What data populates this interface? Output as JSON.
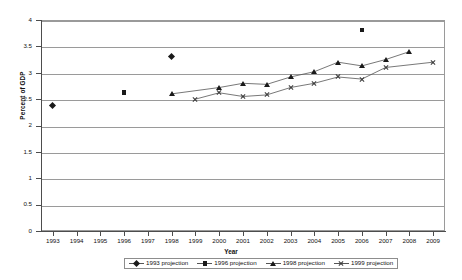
{
  "chart_data": {
    "type": "scatter",
    "title": "",
    "xlabel": "Year",
    "ylabel": "Percent of GDP",
    "xlim": [
      1992.5,
      2009.5
    ],
    "ylim": [
      0,
      4
    ],
    "ytick_step": 0.5,
    "grid": "horizontal",
    "legend_position": "bottom",
    "x_ticks": [
      1993,
      1994,
      1995,
      1996,
      1997,
      1998,
      1999,
      2000,
      2001,
      2002,
      2003,
      2004,
      2005,
      2006,
      2007,
      2008,
      2009
    ],
    "x_tick_labels": [
      "1993",
      "1994",
      "1995",
      "1996",
      "1997",
      "1998",
      "1999",
      "2000",
      "2001",
      "2002",
      "2003",
      "2004",
      "2005",
      "2006",
      "2007",
      "2008",
      "2009"
    ],
    "y_ticks": [
      0,
      0.5,
      1,
      1.5,
      2,
      2.5,
      3,
      3.5,
      4
    ],
    "y_tick_labels": [
      "0",
      "0.5",
      "1",
      "1.5",
      "2",
      "2.5",
      "3",
      "3.5",
      "4"
    ],
    "series": [
      {
        "name": "1993 projection",
        "marker": "diamond",
        "line": false,
        "points": [
          {
            "x": 1993,
            "y": 2.38
          },
          {
            "x": 1998,
            "y": 3.3
          }
        ]
      },
      {
        "name": "1996 projection",
        "marker": "square",
        "line": false,
        "points": [
          {
            "x": 1996,
            "y": 2.62
          },
          {
            "x": 2006,
            "y": 3.81
          }
        ]
      },
      {
        "name": "1998 projection",
        "marker": "triangle",
        "line": true,
        "points": [
          {
            "x": 1998,
            "y": 2.6
          },
          {
            "x": 2000,
            "y": 2.72
          },
          {
            "x": 2001,
            "y": 2.8
          },
          {
            "x": 2002,
            "y": 2.78
          },
          {
            "x": 2003,
            "y": 2.92
          },
          {
            "x": 2004,
            "y": 3.02
          },
          {
            "x": 2005,
            "y": 3.2
          },
          {
            "x": 2006,
            "y": 3.13
          },
          {
            "x": 2007,
            "y": 3.25
          },
          {
            "x": 2008,
            "y": 3.4
          }
        ]
      },
      {
        "name": "1999 projection",
        "marker": "cross",
        "line": true,
        "points": [
          {
            "x": 1999,
            "y": 2.5
          },
          {
            "x": 2000,
            "y": 2.62
          },
          {
            "x": 2001,
            "y": 2.55
          },
          {
            "x": 2002,
            "y": 2.58
          },
          {
            "x": 2003,
            "y": 2.72
          },
          {
            "x": 2004,
            "y": 2.8
          },
          {
            "x": 2005,
            "y": 2.92
          },
          {
            "x": 2006,
            "y": 2.88
          },
          {
            "x": 2007,
            "y": 3.1
          },
          {
            "x": 2009,
            "y": 3.2
          }
        ]
      }
    ]
  },
  "colors": {
    "marker": "#1a1a1a",
    "line": "#555555",
    "grid": "#9a9a9a",
    "axis": "#4d4d4d",
    "background": "#ffffff"
  }
}
